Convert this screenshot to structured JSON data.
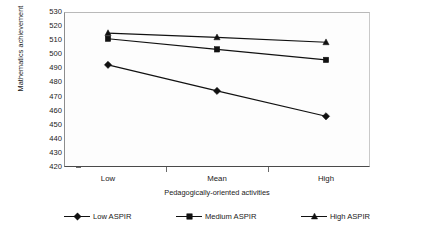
{
  "chart_data": {
    "type": "line",
    "title": "",
    "xlabel": "Pedagogically-oriented activities",
    "ylabel": "Mathematics achievement",
    "categories": [
      "Low",
      "Mean",
      "High"
    ],
    "ylim": [
      420,
      530
    ],
    "ytick_step": 10,
    "yticks": [
      530,
      520,
      510,
      500,
      490,
      480,
      470,
      460,
      450,
      440,
      430,
      420
    ],
    "grid": false,
    "legend_position": "bottom",
    "series": [
      {
        "name": "Low ASPIR",
        "marker": "diamond",
        "values": [
          492.5,
          474,
          456
        ]
      },
      {
        "name": "Medium ASPIR",
        "marker": "square",
        "values": [
          511,
          503.5,
          496
        ]
      },
      {
        "name": "High ASPIR",
        "marker": "triangle",
        "values": [
          515,
          512,
          508.5
        ]
      }
    ]
  },
  "legend": {
    "items": [
      {
        "label": "Low ASPIR",
        "marker": "diamond"
      },
      {
        "label": "Medium ASPIR",
        "marker": "square"
      },
      {
        "label": "High ASPIR",
        "marker": "triangle"
      }
    ]
  },
  "colors": {
    "series": "#111111",
    "plot_background": "#fdfdfd",
    "axis": "#4a4a4a",
    "text": "#1a1a1a"
  }
}
